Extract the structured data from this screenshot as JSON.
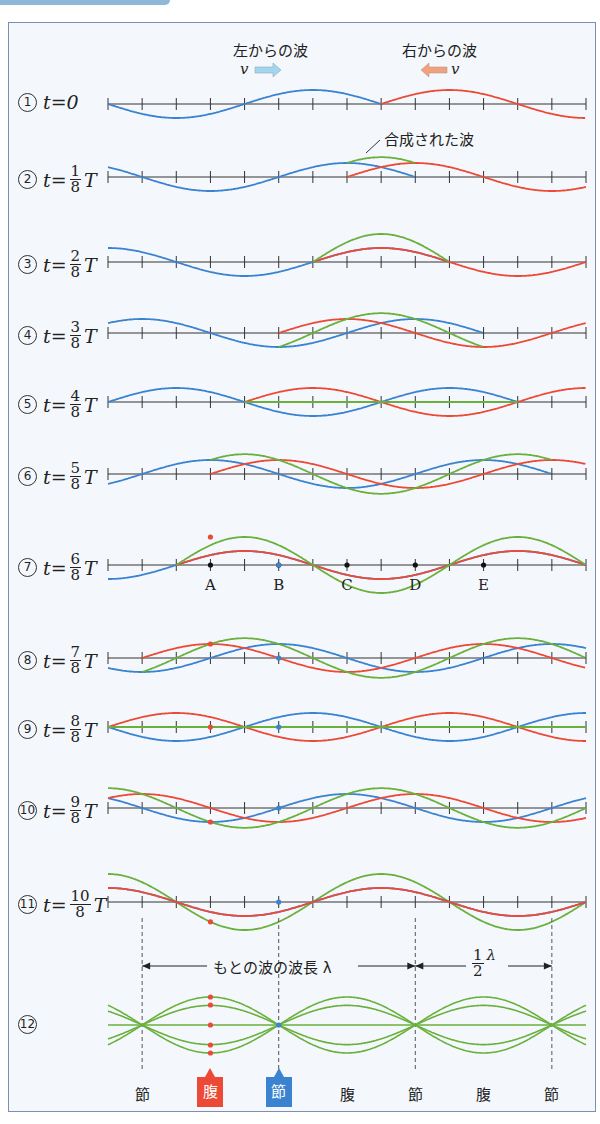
{
  "header": {
    "left_wave_label": "左からの波",
    "right_wave_label": "右からの波",
    "velocity_symbol": "v",
    "composite_label": "合成された波"
  },
  "colors": {
    "left_wave": "#3b82d0",
    "right_wave": "#ec4a36",
    "composite": "#6ab03c",
    "axis": "#333333",
    "frame": "#7b8fb5",
    "arrow_left_fill": "#9fd6f2",
    "arrow_right_fill": "#f4a07a"
  },
  "rows": [
    {
      "num": "①",
      "label": "t=0",
      "n": 0
    },
    {
      "num": "②",
      "prefix": "t=",
      "numerator": "1",
      "denominator": "8",
      "suffix": "T",
      "n": 1
    },
    {
      "num": "③",
      "prefix": "t=",
      "numerator": "2",
      "denominator": "8",
      "suffix": "T",
      "n": 2
    },
    {
      "num": "④",
      "prefix": "t=",
      "numerator": "3",
      "denominator": "8",
      "suffix": "T",
      "n": 3
    },
    {
      "num": "⑤",
      "prefix": "t=",
      "numerator": "4",
      "denominator": "8",
      "suffix": "T",
      "n": 4
    },
    {
      "num": "⑥",
      "prefix": "t=",
      "numerator": "5",
      "denominator": "8",
      "suffix": "T",
      "n": 5
    },
    {
      "num": "⑦",
      "prefix": "t=",
      "numerator": "6",
      "denominator": "8",
      "suffix": "T",
      "n": 6
    },
    {
      "num": "⑧",
      "prefix": "t=",
      "numerator": "7",
      "denominator": "8",
      "suffix": "T",
      "n": 7
    },
    {
      "num": "⑨",
      "prefix": "t=",
      "numerator": "8",
      "denominator": "8",
      "suffix": "T",
      "n": 8
    },
    {
      "num": "⑩",
      "prefix": "t=",
      "numerator": "9",
      "denominator": "8",
      "suffix": "T",
      "n": 9
    },
    {
      "num": "⑪",
      "prefix": "t=",
      "numerator": "10",
      "denominator": "8",
      "suffix": "T",
      "n": 10
    },
    {
      "num": "⑫"
    }
  ],
  "points": [
    "A",
    "B",
    "C",
    "D",
    "E"
  ],
  "standing": {
    "wavelength_label": "もとの波の波長 λ",
    "half_num": "1",
    "half_den": "2",
    "half_sym": "λ",
    "labels": [
      "節",
      "腹",
      "節",
      "腹",
      "節",
      "腹",
      "節"
    ],
    "highlight_antinode": "腹",
    "highlight_node": "節"
  }
}
